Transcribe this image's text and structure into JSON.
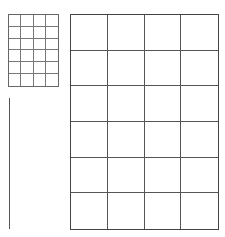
{
  "diagram": {
    "small_grid": {
      "rows": 6,
      "cols": 4,
      "line_color": "#666666"
    },
    "large_grid": {
      "rows": 6,
      "cols": 4,
      "line_color": "#444444"
    },
    "vertical_line": {
      "color": "#555555"
    },
    "background": "#ffffff"
  }
}
